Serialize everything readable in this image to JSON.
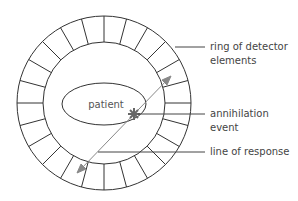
{
  "diagram": {
    "ring": {
      "center": [
        104,
        103
      ],
      "outer_radius": 87,
      "inner_radius": 61,
      "segments": 24,
      "stroke": "#333333"
    },
    "patient": {
      "label": "patient",
      "center": [
        104,
        104
      ],
      "rx": 42,
      "ry": 21
    },
    "annihilation_point": [
      134,
      114
    ],
    "line_of_response": {
      "from": [
        77,
        173
      ],
      "to": [
        171,
        76
      ],
      "color": "#888888"
    },
    "labels": [
      {
        "id": "ring",
        "text_line1": "ring of detector",
        "text_line2": "elements"
      },
      {
        "id": "event",
        "text_line1": "annihilation",
        "text_line2": "event"
      },
      {
        "id": "lor",
        "text_line1": "line of response"
      }
    ]
  }
}
